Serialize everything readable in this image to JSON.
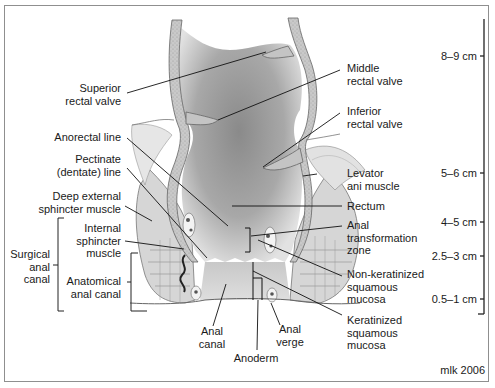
{
  "figure": {
    "credit": "mlk 2006"
  },
  "labels": {
    "superior_rectal_valve": "Superior\nrectal valve",
    "middle_rectal_valve": "Middle\nrectal valve",
    "inferior_rectal_valve": "Inferior\nrectal valve",
    "levator_ani_muscle": "Levator\nani muscle",
    "anorectal_line": "Anorectal line",
    "pectinate_line": "Pectinate\n(dentate) line",
    "deep_external_sphincter": "Deep external\nsphincter muscle",
    "internal_sphincter": "Internal\nsphincter\nmuscle",
    "surgical_anal_canal": "Surgical\nanal\ncanal",
    "anatomical_anal_canal": "Anatomical\nanal canal",
    "rectum": "Rectum",
    "anal_transformation_zone": "Anal\ntransformation\nzone",
    "non_keratinized_mucosa": "Non-keratinized\nsquamous\nmucosa",
    "keratinized_mucosa": "Keratinized\nsquamous\nmucosa",
    "anal_canal": "Anal\ncanal",
    "anal_verge": "Anal\nverge",
    "anoderm": "Anoderm"
  },
  "scale": {
    "ticks": [
      {
        "label": "8–9 cm",
        "y": 56
      },
      {
        "label": "5–6 cm",
        "y": 173
      },
      {
        "label": "4–5 cm",
        "y": 222
      },
      {
        "label": "2.5–3 cm",
        "y": 256
      },
      {
        "label": "0.5–1 cm",
        "y": 299
      }
    ]
  },
  "colors": {
    "frame": "#8f8f8f",
    "line": "#1a1a1a",
    "lumen_dark": "#7a7a7a",
    "lumen_light": "#d8d8d8",
    "wall": "#bdbdbd",
    "muscle": "#cfcfcf"
  }
}
